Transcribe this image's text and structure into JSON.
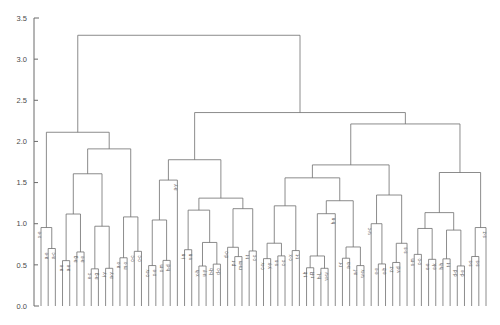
{
  "chart_data": {
    "type": "dendrogram",
    "title": "",
    "subtitle": "",
    "xlabel": "",
    "ylabel": "",
    "orientation": "vertical",
    "grid": false,
    "legend": false,
    "ylim": [
      0.0,
      3.5
    ],
    "yticks": [
      0.0,
      0.5,
      1.0,
      1.5,
      2.0,
      2.5,
      3.0,
      3.5
    ],
    "ytick_labels": [
      "0.0",
      "0.5",
      "1.0",
      "1.5",
      "2.0",
      "2.5",
      "3.0",
      "3.5"
    ],
    "xlim": [
      0,
      63
    ],
    "leaf_count": 63,
    "leaf_labels": [
      "x-e",
      "a-e",
      "a-c",
      "a-e",
      "a-e",
      "a-g",
      "a-e",
      "e-c",
      "a-g",
      "i-y",
      "a-y",
      "a-x",
      "m-x",
      "o-c",
      "o-c",
      "o-w",
      "o-e",
      "o-m",
      "h-d",
      "a-y",
      "i-n",
      "v-n",
      "x-h",
      "u-y",
      "b-b",
      "d-o",
      "d-o",
      "p-r",
      "m-m",
      "t-t",
      "c-c",
      "c-w",
      "y-y",
      "s-s",
      "c-c",
      "c-x",
      "t-t",
      "t-b",
      "r-R",
      "h-L",
      "w-w",
      "h-n",
      "r-r",
      "a-a",
      "a-f",
      "w-w",
      "w-c",
      "e-e",
      "e-b",
      "z-z",
      "v-d",
      "s-s",
      "s-m",
      "o-o",
      "e-e",
      "e-k",
      "h-h",
      "t-t",
      "d-d",
      "d-e",
      "s-s",
      "s-s",
      "s-z"
    ],
    "leaf_label_rotation": -90,
    "axis_color": "#6b6b6b",
    "link_color": "#6e6e6e",
    "background_color": "#ffffff",
    "links": [
      {
        "id": "n1",
        "left": 1,
        "right": 2,
        "height": 0.62,
        "lh": 0.0,
        "rh": 0.0
      },
      {
        "id": "n2",
        "left": 3,
        "right": 4,
        "height": 0.55,
        "lh": 0.0,
        "rh": 0.0
      },
      {
        "id": "n3",
        "left": 5,
        "right": 6,
        "height": 0.8,
        "lh": 0.0,
        "rh": 0.0
      },
      {
        "id": "n4",
        "left": 7,
        "right": 8,
        "height": 0.72,
        "lh": 0.0,
        "rh": 0.0
      },
      {
        "id": "n5",
        "left": 9,
        "right": 10,
        "height": 0.6,
        "lh": 0.0,
        "rh": 0.0
      },
      {
        "id": "n6",
        "left": 11,
        "right": 12,
        "height": 1.1,
        "lh": 0.0,
        "rh": 0.0
      },
      {
        "id": "n7",
        "left": 13,
        "right": 14,
        "height": 1.18,
        "lh": 0.0,
        "rh": 0.0
      },
      {
        "id": "n8",
        "left": 15,
        "right": 16,
        "height": 0.95,
        "lh": 0.0,
        "rh": 0.0
      },
      {
        "id": "n9",
        "left": 17,
        "right": 18,
        "height": 1.3,
        "lh": 0.0,
        "rh": 0.0
      },
      {
        "id": "n10",
        "left": 19,
        "right": 20,
        "height": 0.7,
        "lh": 0.0,
        "rh": 0.0
      }
    ]
  },
  "axis": {
    "y_tick_text": [
      "3.5",
      "3.0",
      "2.5",
      "2.0",
      "1.5",
      "1.0",
      "0.5",
      "0.0"
    ]
  }
}
